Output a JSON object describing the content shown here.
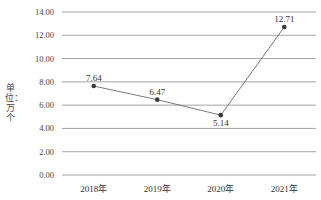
{
  "chart_data": {
    "type": "line",
    "title": "",
    "xlabel": "",
    "ylabel": "单位：万个",
    "categories": [
      "2018年",
      "2019年",
      "2020年",
      "2021年"
    ],
    "series": [
      {
        "name": "",
        "values": [
          7.64,
          6.47,
          5.14,
          12.71
        ],
        "labels": [
          "7.64",
          "6.47",
          "5.14",
          "12.71"
        ]
      }
    ],
    "ylim": [
      0,
      14
    ],
    "yticks": [
      "0.00",
      "2.00",
      "4.00",
      "6.00",
      "8.00",
      "10.00",
      "12.00",
      "14.00"
    ],
    "grid": true,
    "legend": "none",
    "colors": {
      "line": "#6b6b6b",
      "marker": "#3a3a3a",
      "grid": "#8c8c8c"
    }
  }
}
